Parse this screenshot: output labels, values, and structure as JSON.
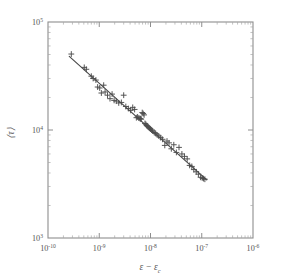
{
  "chart_data": {
    "type": "scatter",
    "title": "",
    "subtitle": "",
    "xlabel": "ε − ε_c",
    "ylabel": "⟨τ⟩",
    "xscale": "log",
    "yscale": "log",
    "xlim": [
      1e-10,
      1e-06
    ],
    "ylim": [
      1000,
      100000
    ],
    "grid": false,
    "legend": null,
    "marker": "plus",
    "marker_color": "#4d4d4d",
    "line_color": "#4a4a4a",
    "frame_color": "#8e8e8e",
    "x_ticklabels": [
      {
        "mantissa": "10",
        "exponent": "-10",
        "value": 1e-10
      },
      {
        "mantissa": "10",
        "exponent": "-9",
        "value": 1e-09
      },
      {
        "mantissa": "10",
        "exponent": "-8",
        "value": 1e-08
      },
      {
        "mantissa": "10",
        "exponent": "-7",
        "value": 1e-07
      },
      {
        "mantissa": "10",
        "exponent": "-6",
        "value": 1e-06
      }
    ],
    "y_ticklabels": [
      {
        "mantissa": "10",
        "exponent": "5",
        "value": 100000
      },
      {
        "mantissa": "10",
        "exponent": "4",
        "value": 10000
      },
      {
        "mantissa": "10",
        "exponent": "3",
        "value": 1000
      }
    ],
    "fit": {
      "form": "power-law",
      "exponent": -0.45,
      "x_start": 2.6e-10,
      "y_start": 48000,
      "x_end": 1.25e-07,
      "y_end": 3450
    },
    "points": [
      {
        "x": 2.85e-10,
        "y": 50500
      },
      {
        "x": 5.1e-10,
        "y": 38000
      },
      {
        "x": 5.6e-10,
        "y": 36500
      },
      {
        "x": 7e-10,
        "y": 31500
      },
      {
        "x": 7.6e-10,
        "y": 30000
      },
      {
        "x": 8.6e-10,
        "y": 29000
      },
      {
        "x": 9.3e-10,
        "y": 25000
      },
      {
        "x": 1.02e-09,
        "y": 24500
      },
      {
        "x": 1.1e-09,
        "y": 22000
      },
      {
        "x": 1.22e-09,
        "y": 26000
      },
      {
        "x": 1.3e-09,
        "y": 22500
      },
      {
        "x": 1.45e-09,
        "y": 21000
      },
      {
        "x": 1.62e-09,
        "y": 19500
      },
      {
        "x": 1.78e-09,
        "y": 21500
      },
      {
        "x": 1.95e-09,
        "y": 18800
      },
      {
        "x": 2.15e-09,
        "y": 18500
      },
      {
        "x": 2.4e-09,
        "y": 17800
      },
      {
        "x": 2.7e-09,
        "y": 18000
      },
      {
        "x": 3e-09,
        "y": 21000
      },
      {
        "x": 3.3e-09,
        "y": 16500
      },
      {
        "x": 3.7e-09,
        "y": 15800
      },
      {
        "x": 4.1e-09,
        "y": 15200
      },
      {
        "x": 4.5e-09,
        "y": 16200
      },
      {
        "x": 4.9e-09,
        "y": 15500
      },
      {
        "x": 5.3e-09,
        "y": 13000
      },
      {
        "x": 5.6e-09,
        "y": 13200
      },
      {
        "x": 5.9e-09,
        "y": 12900
      },
      {
        "x": 6.2e-09,
        "y": 12800
      },
      {
        "x": 6.4e-09,
        "y": 12700
      },
      {
        "x": 6.6e-09,
        "y": 12600
      },
      {
        "x": 6.9e-09,
        "y": 14500
      },
      {
        "x": 7.2e-09,
        "y": 14200
      },
      {
        "x": 7.5e-09,
        "y": 13800
      },
      {
        "x": 7.8e-09,
        "y": 11500
      },
      {
        "x": 8.1e-09,
        "y": 11300
      },
      {
        "x": 8.4e-09,
        "y": 11000
      },
      {
        "x": 8.8e-09,
        "y": 10800
      },
      {
        "x": 9.2e-09,
        "y": 10600
      },
      {
        "x": 9.6e-09,
        "y": 10400
      },
      {
        "x": 1e-08,
        "y": 10200
      },
      {
        "x": 1.05e-08,
        "y": 10000
      },
      {
        "x": 1.1e-08,
        "y": 9800
      },
      {
        "x": 1.18e-08,
        "y": 9500
      },
      {
        "x": 1.26e-08,
        "y": 9300
      },
      {
        "x": 1.35e-08,
        "y": 9000
      },
      {
        "x": 1.45e-08,
        "y": 8800
      },
      {
        "x": 1.58e-08,
        "y": 8500
      },
      {
        "x": 1.72e-08,
        "y": 8200
      },
      {
        "x": 1.9e-08,
        "y": 7200
      },
      {
        "x": 2.1e-08,
        "y": 7900
      },
      {
        "x": 2.3e-08,
        "y": 7600
      },
      {
        "x": 2.55e-08,
        "y": 6700
      },
      {
        "x": 2.85e-08,
        "y": 7300
      },
      {
        "x": 3.2e-08,
        "y": 6200
      },
      {
        "x": 3.6e-08,
        "y": 6900
      },
      {
        "x": 4.1e-08,
        "y": 6000
      },
      {
        "x": 4.6e-08,
        "y": 5700
      },
      {
        "x": 5.2e-08,
        "y": 5400
      },
      {
        "x": 5.8e-08,
        "y": 4700
      },
      {
        "x": 6.4e-08,
        "y": 4600
      },
      {
        "x": 7e-08,
        "y": 4300
      },
      {
        "x": 7.8e-08,
        "y": 4100
      },
      {
        "x": 8.6e-08,
        "y": 3900
      },
      {
        "x": 9.5e-08,
        "y": 3650
      },
      {
        "x": 1.02e-07,
        "y": 3600
      },
      {
        "x": 1.08e-07,
        "y": 3550
      },
      {
        "x": 1.15e-07,
        "y": 3500
      }
    ]
  }
}
